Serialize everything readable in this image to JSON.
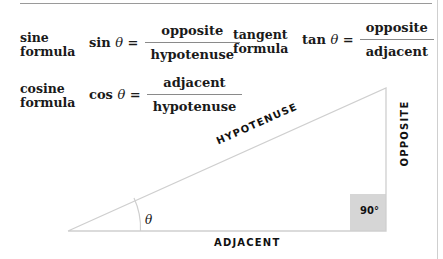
{
  "formulas": {
    "sine": {
      "name_line1": "sine",
      "name_line2": "formula",
      "lhs": "sin",
      "theta": "θ",
      "eq": "=",
      "numerator": "opposite",
      "denominator": "hypotenuse"
    },
    "tangent": {
      "name_line1": "tangent",
      "name_line2": "formula",
      "lhs": "tan",
      "theta": "θ",
      "eq": "=",
      "numerator": "opposite",
      "denominator": "adjacent"
    },
    "cosine": {
      "name_line1": "cosine",
      "name_line2": "formula",
      "lhs": "cos",
      "theta": "θ",
      "eq": "=",
      "numerator": "adjacent",
      "denominator": "hypotenuse"
    }
  },
  "triangle": {
    "hypotenuse_label": "HYPOTENUSE",
    "opposite_label": "OPPOSITE",
    "adjacent_label": "ADJACENT",
    "angle_label": "θ",
    "right_angle_label": "90°",
    "right_angle_fill": "#d6d6d6",
    "line_color": "#cfcfcf"
  }
}
